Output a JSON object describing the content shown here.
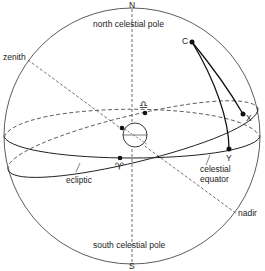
{
  "diagram": {
    "labels": {
      "north_pole_letter": "N",
      "south_pole_letter": "S",
      "north_celestial_pole": "north celestial pole",
      "south_celestial_pole": "south celestial pole",
      "zenith": "zenith",
      "nadir": "nadir",
      "ecliptic": "ecliptic",
      "celestial_equator_line1": "celestial",
      "celestial_equator_line2": "equator",
      "point_c": "C",
      "point_x": "X",
      "point_y": "Y",
      "vernal_equinox_symbol": "♈",
      "autumnal_equinox_symbol": "♎"
    },
    "colors": {
      "line": "#222222",
      "background": "#ffffff"
    }
  }
}
